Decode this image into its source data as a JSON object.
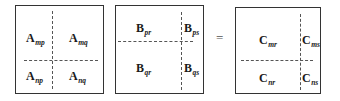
{
  "diagram": {
    "matrices": [
      {
        "name": "A",
        "blocks": [
          {
            "letter": "A",
            "sub": "mp"
          },
          {
            "letter": "A",
            "sub": "mq"
          },
          {
            "letter": "A",
            "sub": "np"
          },
          {
            "letter": "A",
            "sub": "nq"
          }
        ]
      },
      {
        "name": "B",
        "blocks": [
          {
            "letter": "B",
            "sub": "pr"
          },
          {
            "letter": "B",
            "sub": "ps"
          },
          {
            "letter": "B",
            "sub": "qr"
          },
          {
            "letter": "B",
            "sub": "qs"
          }
        ]
      },
      {
        "name": "C",
        "blocks": [
          {
            "letter": "C",
            "sub": "mr"
          },
          {
            "letter": "C",
            "sub": "ms"
          },
          {
            "letter": "C",
            "sub": "nr"
          },
          {
            "letter": "C",
            "sub": "ns"
          }
        ]
      }
    ],
    "operator": "="
  }
}
